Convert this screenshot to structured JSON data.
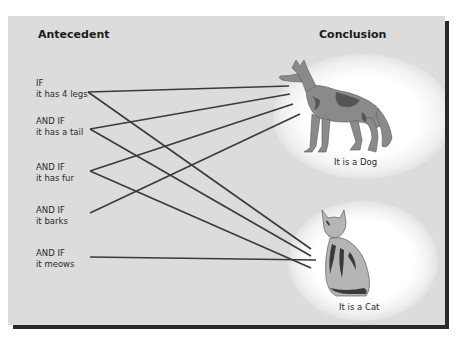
{
  "diagram": {
    "antecedent_heading": "Antecedent",
    "conclusion_heading": "Conclusion",
    "conditions": [
      {
        "connector": "IF",
        "text": "it has 4 legs"
      },
      {
        "connector": "AND IF",
        "text": "it has a tail"
      },
      {
        "connector": "AND IF",
        "text": "it has fur"
      },
      {
        "connector": "AND IF",
        "text": "it barks"
      },
      {
        "connector": "AND IF",
        "text": "it meows"
      }
    ],
    "conclusions": [
      {
        "animal": "dog",
        "icon": "dog-illustration",
        "caption": "It is a Dog"
      },
      {
        "animal": "cat",
        "icon": "cat-illustration",
        "caption": "It is a Cat"
      }
    ],
    "links": [
      {
        "from": "it has 4 legs",
        "to": "It is a Dog"
      },
      {
        "from": "it has 4 legs",
        "to": "It is a Cat"
      },
      {
        "from": "it has a tail",
        "to": "It is a Dog"
      },
      {
        "from": "it has a tail",
        "to": "It is a Cat"
      },
      {
        "from": "it has fur",
        "to": "It is a Dog"
      },
      {
        "from": "it has fur",
        "to": "It is a Cat"
      },
      {
        "from": "it barks",
        "to": "It is a Dog"
      },
      {
        "from": "it meows",
        "to": "It is a Cat"
      }
    ],
    "colors": {
      "panel": "#dcdcdc",
      "line": "#3a3a3a",
      "shadow": "#2a2a2a",
      "glow": "#ffffff"
    }
  }
}
